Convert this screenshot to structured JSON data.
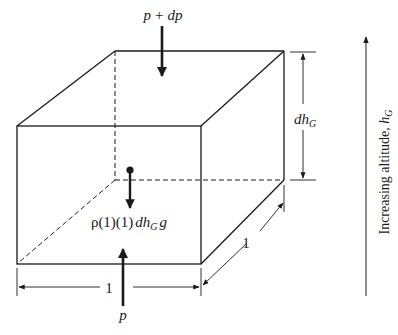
{
  "diagram": {
    "type": "fluid-element-free-body",
    "colors": {
      "line": "#1a1a1a",
      "background": "#ffffff"
    },
    "labels": {
      "top_pressure": {
        "p": "p",
        "plus": "+",
        "dp": "dp"
      },
      "bottom_pressure": "p",
      "weight": {
        "prefix": "ρ(1)(1)",
        "dh": "dh",
        "sub": "G",
        "g": "g"
      },
      "height_dim": {
        "dh": "dh",
        "sub": "G"
      },
      "width_dim": "1",
      "depth_dim": "1",
      "altitude_axis": {
        "text": "Increasing altitude, ",
        "h": "h",
        "sub": "G"
      }
    }
  }
}
